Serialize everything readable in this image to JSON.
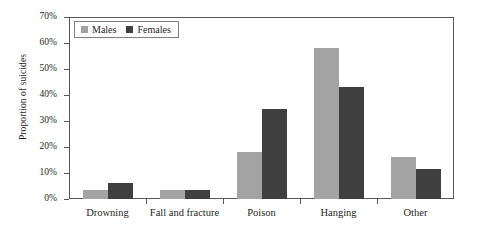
{
  "chart_data": {
    "type": "bar",
    "title": "",
    "xlabel": "",
    "ylabel": "Proportion of suicides",
    "categories": [
      "Drowning",
      "Fall and fracture",
      "Poison",
      "Hanging",
      "Other"
    ],
    "series": [
      {
        "name": "Males",
        "color": "#a3a3a3",
        "values": [
          3.5,
          3.5,
          18,
          58,
          16
        ]
      },
      {
        "name": "Females",
        "color": "#3f3f3f",
        "values": [
          6,
          3.5,
          34.5,
          43,
          11.5
        ]
      }
    ],
    "ylim": [
      0,
      70
    ],
    "ytick_values": [
      0,
      10,
      20,
      30,
      40,
      50,
      60,
      70
    ],
    "ytick_labels": [
      "0%",
      "10%",
      "20%",
      "30%",
      "40%",
      "50%",
      "60%",
      "70%"
    ],
    "grid": false,
    "legend_position": "top-left-inside",
    "legend": [
      {
        "label": "Males",
        "swatch": "legend-swatch-males"
      },
      {
        "label": "Females",
        "swatch": "legend-swatch-females"
      }
    ]
  }
}
